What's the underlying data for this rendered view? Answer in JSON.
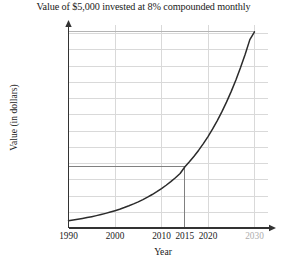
{
  "chart_data": {
    "type": "line",
    "title": "Value of $5,000 invested at 8% compounded monthly",
    "xlabel": "Year",
    "ylabel": "Value (in dollars)",
    "xlim": [
      1990,
      2032
    ],
    "ylim": [
      0,
      125000
    ],
    "grid": true,
    "legend": null,
    "x_ticks": [
      {
        "value": 1990,
        "label": "1990",
        "muted": false,
        "gridline": false
      },
      {
        "value": 2000,
        "label": "2000",
        "muted": false,
        "gridline": true
      },
      {
        "value": 2010,
        "label": "2010",
        "muted": false,
        "gridline": true
      },
      {
        "value": 2015,
        "label": "2015",
        "muted": false,
        "gridline": false
      },
      {
        "value": 2020,
        "label": "2020",
        "muted": false,
        "gridline": true
      },
      {
        "value": 2030,
        "label": "2030",
        "muted": true,
        "gridline": true
      }
    ],
    "y_ticks": [
      {
        "value": 10000,
        "label": "10,000",
        "muted": false
      },
      {
        "value": 20000,
        "label": "20,000",
        "muted": false
      },
      {
        "value": 30000,
        "label": "30,000",
        "muted": false
      },
      {
        "value": 38000,
        "label": "38,000",
        "muted": false
      },
      {
        "value": 40000,
        "label": "40,000",
        "muted": false
      },
      {
        "value": 50000,
        "label": "50,000",
        "muted": false
      },
      {
        "value": 60000,
        "label": "60,000",
        "muted": false
      },
      {
        "value": 70000,
        "label": "70,000",
        "muted": false
      },
      {
        "value": 80000,
        "label": "80,000",
        "muted": false
      },
      {
        "value": 90000,
        "label": "90,000",
        "muted": false
      },
      {
        "value": 100000,
        "label": "100,000",
        "muted": false
      },
      {
        "value": 110000,
        "label": "110,000",
        "muted": false
      },
      {
        "value": 120000,
        "label": "120,000",
        "muted": false
      },
      {
        "value": 121000,
        "label": "121,000",
        "muted": true
      }
    ],
    "gridline_y_values": [
      10000,
      20000,
      30000,
      40000,
      50000,
      60000,
      70000,
      80000,
      90000,
      100000,
      110000,
      120000
    ],
    "series": [
      {
        "name": "Account value",
        "color": "#2b2b2b",
        "points": [
          {
            "x": 1990,
            "y": 5000
          },
          {
            "x": 1991,
            "y": 5416
          },
          {
            "x": 1992,
            "y": 5866
          },
          {
            "x": 1993,
            "y": 6354
          },
          {
            "x": 1994,
            "y": 6882
          },
          {
            "x": 1995,
            "y": 7454
          },
          {
            "x": 1996,
            "y": 8074
          },
          {
            "x": 1997,
            "y": 8745
          },
          {
            "x": 1998,
            "y": 9472
          },
          {
            "x": 1999,
            "y": 10259
          },
          {
            "x": 2000,
            "y": 11112
          },
          {
            "x": 2001,
            "y": 12036
          },
          {
            "x": 2002,
            "y": 13036
          },
          {
            "x": 2003,
            "y": 14120
          },
          {
            "x": 2004,
            "y": 15293
          },
          {
            "x": 2005,
            "y": 16565
          },
          {
            "x": 2006,
            "y": 17942
          },
          {
            "x": 2007,
            "y": 19433
          },
          {
            "x": 2008,
            "y": 21048
          },
          {
            "x": 2009,
            "y": 22798
          },
          {
            "x": 2010,
            "y": 24693
          },
          {
            "x": 2011,
            "y": 26745
          },
          {
            "x": 2012,
            "y": 28968
          },
          {
            "x": 2013,
            "y": 31376
          },
          {
            "x": 2014,
            "y": 33984
          },
          {
            "x": 2015,
            "y": 38000
          },
          {
            "x": 2016,
            "y": 41165
          },
          {
            "x": 2017,
            "y": 44587
          },
          {
            "x": 2018,
            "y": 48293
          },
          {
            "x": 2019,
            "y": 52307
          },
          {
            "x": 2020,
            "y": 56654
          },
          {
            "x": 2021,
            "y": 61363
          },
          {
            "x": 2022,
            "y": 66463
          },
          {
            "x": 2023,
            "y": 71987
          },
          {
            "x": 2024,
            "y": 77970
          },
          {
            "x": 2025,
            "y": 84450
          },
          {
            "x": 2026,
            "y": 91469
          },
          {
            "x": 2027,
            "y": 99071
          },
          {
            "x": 2028,
            "y": 107306
          },
          {
            "x": 2029,
            "y": 116226
          },
          {
            "x": 2030,
            "y": 121000
          }
        ]
      }
    ],
    "annotations": [
      {
        "name": "value-at-2015",
        "x": 2015,
        "y": 38000,
        "h_line": true,
        "v_line": true,
        "color": "#808080"
      },
      {
        "name": "value-at-2030",
        "x": 2030,
        "y": 121000,
        "h_line": true,
        "v_line": false,
        "color": "#b4b4b4"
      }
    ]
  }
}
